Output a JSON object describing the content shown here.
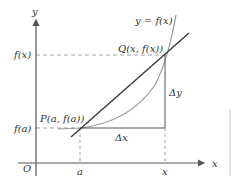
{
  "diagram": {
    "type": "secant-line-diagram",
    "colors": {
      "axis": "#555555",
      "secant": "#3a3a3a",
      "curve": "#9a9a9a",
      "dashed": "#888888",
      "text": "#333333",
      "frame": "#cfcfcf"
    },
    "axes": {
      "y_label": "y",
      "x_label": "x",
      "origin_label": "O"
    },
    "curve_label": "y = f(x)",
    "points": {
      "P": {
        "label": "P(a, f(a))"
      },
      "Q": {
        "label": "Q(x, f(x))"
      }
    },
    "y_ticks": {
      "fx": "f(x)",
      "fa": "f(a)"
    },
    "x_ticks": {
      "a": "a",
      "x": "x"
    },
    "increments": {
      "dx": "Δx",
      "dy": "Δy"
    }
  }
}
